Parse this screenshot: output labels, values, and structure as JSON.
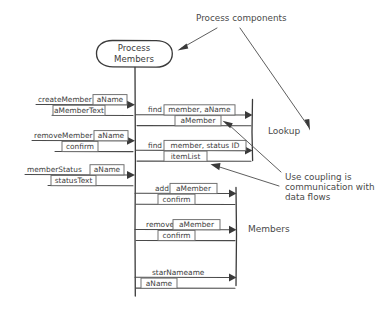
{
  "diagram": {
    "style": "hand-drawn sketch",
    "colors": {
      "ink": "#3a3a3a",
      "box_stroke": "#6b6b6b",
      "paper": "#ffffff"
    },
    "actor": {
      "name": "process-members",
      "line1": "Process",
      "line2": "Members"
    },
    "annotations": [
      {
        "name": "process-components",
        "text": "Process components"
      },
      {
        "name": "use-coupling",
        "line1": "Use coupling is",
        "line2": "communication with",
        "line3": "data flows"
      }
    ],
    "group_labels": [
      {
        "name": "lookup",
        "text": "Lookup"
      },
      {
        "name": "members",
        "text": "Members"
      }
    ],
    "incoming_messages": [
      {
        "name": "create-member",
        "label": "createMember",
        "param": "aName",
        "reply": "aMemberText"
      },
      {
        "name": "remove-member",
        "label": "removeMember",
        "param": "aName",
        "reply": "confirm"
      },
      {
        "name": "member-status",
        "label": "memberStatus",
        "param": "aName",
        "reply": "statusText"
      }
    ],
    "lookup_messages": [
      {
        "name": "find-member-aname",
        "label": "find",
        "param": "member, aName",
        "reply": "aMember"
      },
      {
        "name": "find-member-status-id",
        "label": "find",
        "param": "member, status ID",
        "reply": "itemList"
      }
    ],
    "members_messages": [
      {
        "name": "add-member",
        "label": "add",
        "param": "aMember",
        "reply": "confirm"
      },
      {
        "name": "remove-member-call",
        "label": "remove",
        "param": "aMember",
        "reply": "confirm"
      },
      {
        "name": "star-nameame",
        "label": "starNameame",
        "param": "",
        "reply": "aName"
      }
    ]
  }
}
